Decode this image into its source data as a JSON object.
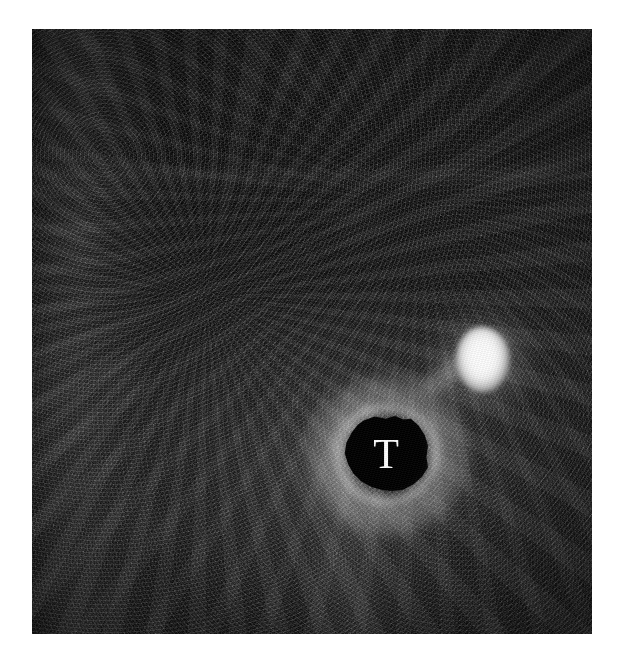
{
  "figure": {
    "domain": "grayscale medical imaging panel",
    "panel_frame": {
      "background_color": "#ffffff",
      "image_left_px": 32,
      "image_top_px": 29,
      "image_width_px": 560,
      "image_height_px": 605
    },
    "annotations": [
      {
        "id": "lesion-label",
        "text": "T",
        "meaning": "tumor",
        "color": "#ffffff",
        "typeface_style": "serif",
        "center_x_px": 354,
        "center_y_px": 424
      }
    ],
    "features": [
      {
        "id": "lesion-core",
        "label": "hypoechoic lesion",
        "appearance": "irregular near-black mass",
        "fill_color": "#000000",
        "center_x_px": 354,
        "center_y_px": 424,
        "width_px": 86,
        "height_px": 77
      },
      {
        "id": "lesion-rim",
        "label": "bright rim / halo around lesion",
        "appearance": "thin hyperechoic border",
        "fill_color": "#bfbfbf"
      },
      {
        "id": "bright-spot",
        "label": "focal hyperechoic bright spot",
        "appearance": "small intense white ovoid",
        "fill_color": "#ffffff",
        "center_x_px": 451,
        "center_y_px": 331,
        "width_px": 54,
        "height_px": 66
      },
      {
        "id": "bridge-streak",
        "label": "diagonal signal bridge",
        "appearance": "faint bright band linking bright spot to lesion rim",
        "fill_color": "#9a9a9a"
      },
      {
        "id": "streak-vert",
        "label": "vertical posterior streak",
        "appearance": "broad faint bright column below the lesion",
        "fill_color": "#555555"
      },
      {
        "id": "left-band",
        "label": "left vertical brighter band",
        "appearance": "soft lighter column near the left margin",
        "fill_color": "#3e3e3e"
      },
      {
        "id": "scan-band",
        "label": "horizontal scan line band",
        "appearance": "faint horizontal lighter line in the upper third",
        "fill_color": "#2a2a2a"
      },
      {
        "id": "background-field",
        "label": "speckled tissue background",
        "appearance": "dark grainy speckle field",
        "fill_color": "#101010"
      }
    ],
    "palette": {
      "paper_white": "#ffffff",
      "field_black": "#0b0b0b",
      "field_dark_gray": "#1a1a1a",
      "mid_gray": "#4a4a4a",
      "highlight_white": "#ffffff",
      "lesion_black": "#000000"
    }
  }
}
